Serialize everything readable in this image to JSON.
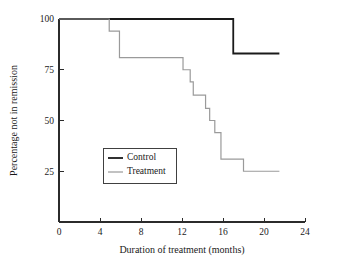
{
  "chart_data": {
    "type": "line",
    "subtype": "step-kaplan-meier",
    "title": "",
    "xlabel": "Duration of treatment (months)",
    "ylabel": "Percentage not in remission",
    "xlim": [
      0,
      24
    ],
    "ylim": [
      0,
      100
    ],
    "xticks": [
      0,
      4,
      8,
      12,
      16,
      20,
      24
    ],
    "xtick_labels": [
      "0",
      "4",
      "8",
      "12",
      "16",
      "20",
      "24"
    ],
    "yticks": [
      25,
      50,
      75,
      100
    ],
    "ytick_labels": [
      "25",
      "50",
      "75",
      "100"
    ],
    "grid": false,
    "legend_position": "center-left",
    "series": [
      {
        "name": "Control",
        "color": "#1a1a1a",
        "line_width": 1.8,
        "step_points": [
          {
            "x": 0,
            "y": 100
          },
          {
            "x": 17.0,
            "y": 100
          },
          {
            "x": 17.0,
            "y": 83
          },
          {
            "x": 21.5,
            "y": 83
          }
        ]
      },
      {
        "name": "Treatment",
        "color": "#9a9a9a",
        "line_width": 1.2,
        "step_points": [
          {
            "x": 0,
            "y": 100
          },
          {
            "x": 4.9,
            "y": 100
          },
          {
            "x": 4.9,
            "y": 94
          },
          {
            "x": 5.9,
            "y": 94
          },
          {
            "x": 5.9,
            "y": 81
          },
          {
            "x": 12.1,
            "y": 81
          },
          {
            "x": 12.1,
            "y": 75
          },
          {
            "x": 12.8,
            "y": 75
          },
          {
            "x": 12.8,
            "y": 69
          },
          {
            "x": 13.1,
            "y": 69
          },
          {
            "x": 13.1,
            "y": 62.5
          },
          {
            "x": 14.3,
            "y": 62.5
          },
          {
            "x": 14.3,
            "y": 56
          },
          {
            "x": 14.7,
            "y": 56
          },
          {
            "x": 14.7,
            "y": 50
          },
          {
            "x": 15.2,
            "y": 50
          },
          {
            "x": 15.2,
            "y": 44
          },
          {
            "x": 15.8,
            "y": 44
          },
          {
            "x": 15.8,
            "y": 31
          },
          {
            "x": 18.0,
            "y": 31
          },
          {
            "x": 18.0,
            "y": 25
          },
          {
            "x": 21.5,
            "y": 25
          }
        ]
      }
    ],
    "legend": [
      {
        "label": "Control",
        "color": "#1a1a1a"
      },
      {
        "label": "Treatment",
        "color": "#9a9a9a"
      }
    ]
  },
  "axes": {
    "x_title": "Duration of treatment (months)",
    "y_title": "Percentage not in remission"
  }
}
